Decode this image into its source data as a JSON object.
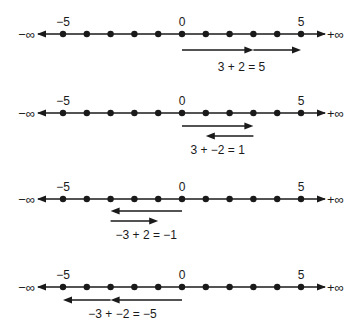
{
  "diagram": {
    "axis": {
      "min": -5,
      "max": 5,
      "tick_labels": [
        "-5",
        "0",
        "5"
      ],
      "label_values": [
        -5,
        0,
        5
      ],
      "neg_infinity_label": "−∞",
      "pos_infinity_label": "+∞"
    },
    "color": "#1a1a1a",
    "panels": [
      {
        "equation": "3 + 2  =  5",
        "arrows": [
          {
            "from": 0,
            "to": 3,
            "row": 0
          },
          {
            "from": 3,
            "to": 5,
            "row": 0
          }
        ]
      },
      {
        "equation": "3 + −2 = 1",
        "arrows": [
          {
            "from": 0,
            "to": 3,
            "row": 0
          },
          {
            "from": 3,
            "to": 1,
            "row": 1
          }
        ]
      },
      {
        "equation": "−3 + 2 = −1",
        "arrows": [
          {
            "from": 0,
            "to": -3,
            "row": 0
          },
          {
            "from": -3,
            "to": -1,
            "row": 1
          }
        ]
      },
      {
        "equation": "−3 + −2  =  −5",
        "arrows": [
          {
            "from": 0,
            "to": -3,
            "row": 0
          },
          {
            "from": -3,
            "to": -5,
            "row": 0
          }
        ]
      }
    ]
  }
}
